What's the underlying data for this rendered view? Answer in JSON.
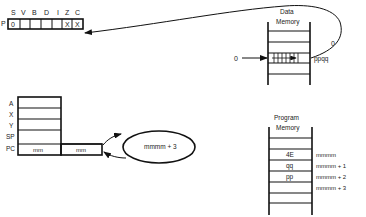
{
  "status_register": {
    "row_label": "P",
    "flags": [
      "S",
      "V",
      "B",
      "D",
      "I",
      "Z",
      "C"
    ],
    "cells": [
      "0",
      "",
      "",
      "",
      "",
      "X",
      "X"
    ]
  },
  "registers": {
    "labels": [
      "A",
      "X",
      "Y",
      "SP",
      "PC"
    ],
    "pc_high": "mm",
    "pc_low": "mm"
  },
  "ellipse": {
    "label": "mmmm + 3"
  },
  "data_memory": {
    "title_line1": "Data",
    "title_line2": "Memory",
    "address_label": "ppqq",
    "input_label": "0",
    "feedback_label": "0"
  },
  "program_memory": {
    "title_line1": "Program",
    "title_line2": "Memory",
    "cells": [
      {
        "value": "4E",
        "address": "mmmm"
      },
      {
        "value": "qq",
        "address": "mmmm + 1"
      },
      {
        "value": "pp",
        "address": "mmmm + 2"
      },
      {
        "value": "",
        "address": "mmmm + 3"
      }
    ]
  }
}
